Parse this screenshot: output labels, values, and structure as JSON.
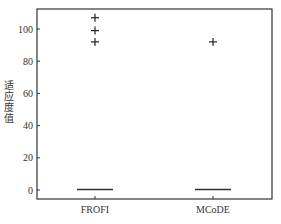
{
  "chart_data": {
    "type": "box",
    "title": "",
    "xlabel": "",
    "ylabel": "适应度值",
    "categories": [
      "FROFI",
      "MCoDE"
    ],
    "ylim": [
      -5,
      113
    ],
    "yticks": [
      0,
      20,
      40,
      60,
      80,
      100
    ],
    "grid": false,
    "legend": null,
    "series": [
      {
        "name": "FROFI",
        "median": 0,
        "q1": 0,
        "q3": 0,
        "whisker_low": 0,
        "whisker_high": 0,
        "outliers": [
          107,
          99,
          92
        ]
      },
      {
        "name": "MCoDE",
        "median": 0,
        "q1": 0,
        "q3": 0,
        "whisker_low": 0,
        "whisker_high": 0,
        "outliers": [
          92
        ]
      }
    ],
    "colors": {
      "axis": "#333333",
      "median": "#333333",
      "outlier": "#222222"
    }
  }
}
